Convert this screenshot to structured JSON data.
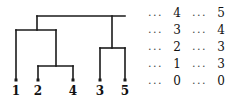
{
  "figure": {
    "type": "dendrogram-with-table",
    "background_color": "#ffffff",
    "line_color": "#1a1a1a",
    "text_color": "#111111"
  },
  "dendrogram": {
    "leaves": [
      {
        "label": "1",
        "x": 16
      },
      {
        "label": "2",
        "x": 38
      },
      {
        "label": "4",
        "x": 73
      },
      {
        "label": "3",
        "x": 100
      },
      {
        "label": "5",
        "x": 125
      }
    ],
    "merges": [
      {
        "name": "merge-2-4",
        "x1": 38,
        "x2": 73,
        "y": 66,
        "stem_x": 56
      },
      {
        "name": "merge-3-5",
        "x1": 100,
        "x2": 125,
        "y": 48,
        "stem_x": 112
      },
      {
        "name": "merge-1-24",
        "x1": 16,
        "x2": 56,
        "y": 30,
        "stem_x": 37
      },
      {
        "name": "merge-root",
        "x1": 37,
        "x2": 125,
        "y": 16,
        "stem_x": 81
      }
    ],
    "leaf_baseline_y": 80,
    "marker_shape": "square",
    "marker_size": 3
  },
  "table": {
    "rows": [
      {
        "dots_left": "...",
        "value_left": "4",
        "dots_right": "...",
        "value_right": "5"
      },
      {
        "dots_left": "...",
        "value_left": "3",
        "dots_right": "...",
        "value_right": "4"
      },
      {
        "dots_left": "...",
        "value_left": "2",
        "dots_right": "...",
        "value_right": "3"
      },
      {
        "dots_left": "...",
        "value_left": "1",
        "dots_right": "...",
        "value_right": "3"
      },
      {
        "dots_left": "...",
        "value_left": "0",
        "dots_right": "...",
        "value_right": "0"
      }
    ]
  }
}
